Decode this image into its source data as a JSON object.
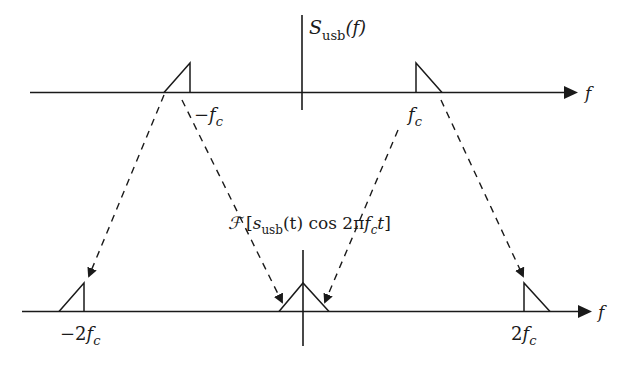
{
  "diagram": {
    "top_plot": {
      "title": "S",
      "title_sub": "usb",
      "title_arg": "(f)",
      "axis_label": "f",
      "ticks": [
        {
          "id": "neg-fc",
          "sign": "−",
          "var": "f",
          "sub": "c"
        },
        {
          "id": "pos-fc",
          "sign": "",
          "var": "f",
          "sub": "c"
        }
      ]
    },
    "middle_label": {
      "operator": "ℱ",
      "open": "[",
      "fn": "s",
      "fn_sub": "usb",
      "fn_arg": "(t) cos 2π",
      "var": "f",
      "var_sub": "c",
      "tail": "t",
      "close": "]"
    },
    "bottom_plot": {
      "axis_label": "f",
      "ticks": [
        {
          "id": "neg-2fc",
          "coef": "−2",
          "var": "f",
          "sub": "c"
        },
        {
          "id": "pos-2fc",
          "coef": "2",
          "var": "f",
          "sub": "c"
        }
      ]
    },
    "arrows": [
      {
        "from": "-fc left edge",
        "to": "-2fc"
      },
      {
        "from": "-fc right edge",
        "to": "0 (left)"
      },
      {
        "from": "fc left edge",
        "to": "0 (right)"
      },
      {
        "from": "fc right edge",
        "to": "2fc"
      }
    ],
    "colors": {
      "ink": "#1a1a1a",
      "background": "#ffffff"
    }
  }
}
